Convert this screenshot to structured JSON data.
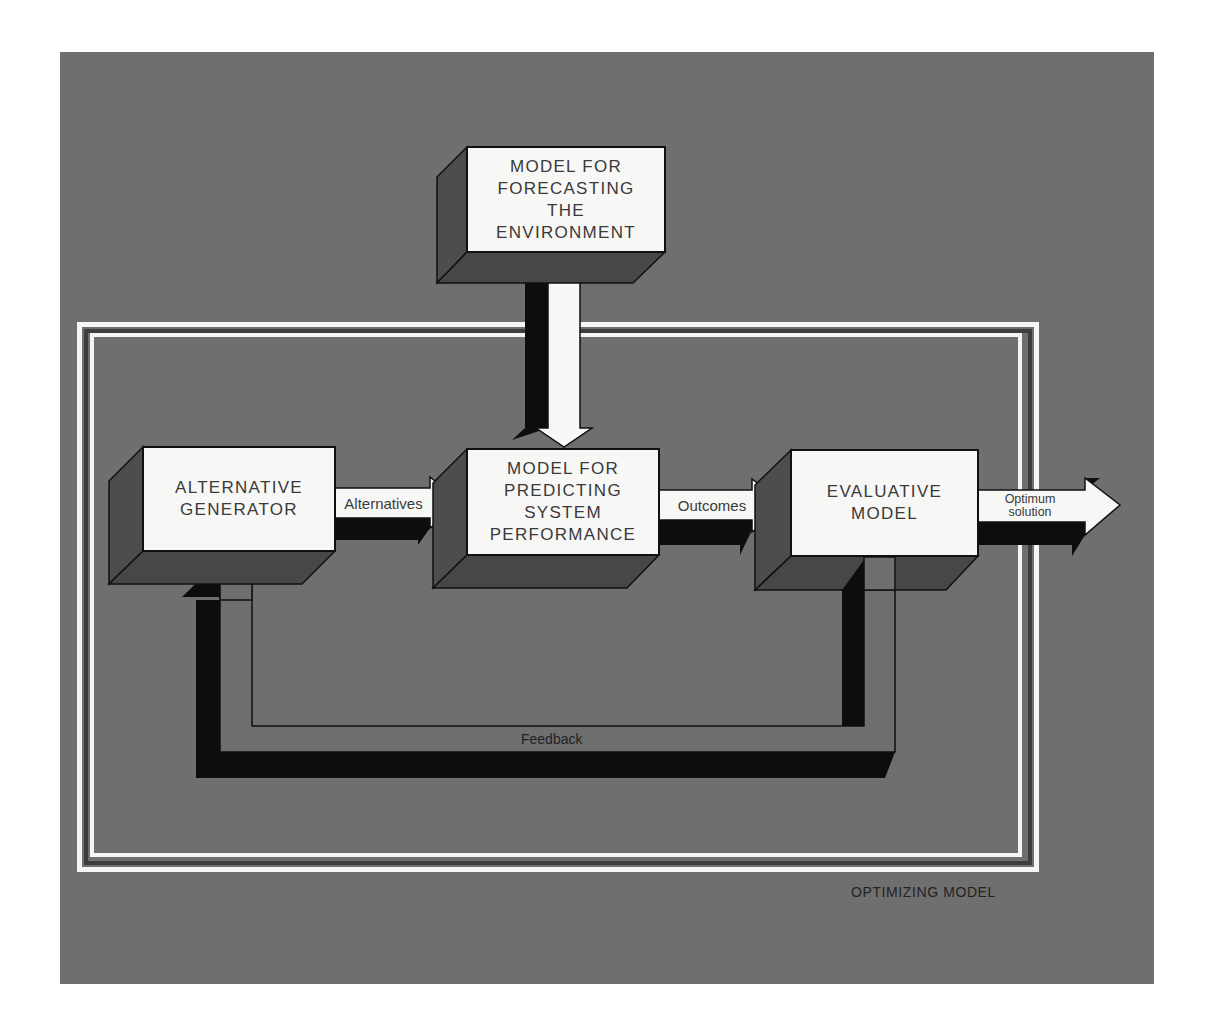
{
  "diagram": {
    "frame_label": "OPTIMIZING MODEL",
    "boxes": [
      {
        "id": "forecast",
        "lines": [
          "MODEL FOR",
          "FORECASTING",
          "THE",
          "ENVIRONMENT"
        ]
      },
      {
        "id": "generator",
        "lines": [
          "ALTERNATIVE",
          "GENERATOR"
        ]
      },
      {
        "id": "predict",
        "lines": [
          "MODEL FOR",
          "PREDICTING",
          "SYSTEM",
          "PERFORMANCE"
        ]
      },
      {
        "id": "evaluate",
        "lines": [
          "EVALUATIVE",
          "MODEL"
        ]
      }
    ],
    "arrows": {
      "alternatives": "Alternatives",
      "outcomes": "Outcomes",
      "optimum_line1": "Optimum",
      "optimum_line2": "solution",
      "feedback": "Feedback"
    },
    "colors": {
      "background": "#6f6f6f",
      "box_face": "#f7f7f5",
      "box_side": "#4d4d4d",
      "shadow": "#0d0d0d",
      "frame": "#f5f5f5",
      "text": "#3a3a3a"
    }
  }
}
